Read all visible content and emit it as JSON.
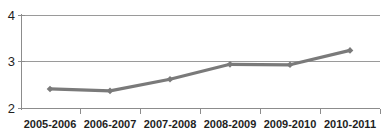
{
  "chart_data": {
    "type": "line",
    "title": "Invested",
    "title_cropped": true,
    "xlabel": "",
    "ylabel": "",
    "categories": [
      "2005-2006",
      "2006-2007",
      "2007-2008",
      "2008-2009",
      "2009-2010",
      "2010-2011"
    ],
    "series": [
      {
        "name": "Invested",
        "values": [
          2.42,
          2.38,
          2.63,
          2.95,
          2.94,
          3.25
        ],
        "color": "#7a7a7a",
        "marker": "diamond"
      }
    ],
    "ylim": [
      2,
      4
    ],
    "yticks": [
      2,
      3,
      4
    ],
    "ytick_labels": [
      "2",
      "3",
      "4"
    ],
    "grid": true,
    "grid_axis": "y",
    "legend": false,
    "legend_position": "none",
    "axis_color": "#8c8c8c",
    "gridline_color": "#9a9a9a",
    "text_color": "#1f1f1f",
    "background": "#ffffff"
  },
  "labels": {
    "y_0": "2",
    "y_1": "3",
    "y_2": "4",
    "x_0": "2005-2006",
    "x_1": "2006-2007",
    "x_2": "2007-2008",
    "x_3": "2008-2009",
    "x_4": "2009-2010",
    "x_5": "2010-2011"
  }
}
